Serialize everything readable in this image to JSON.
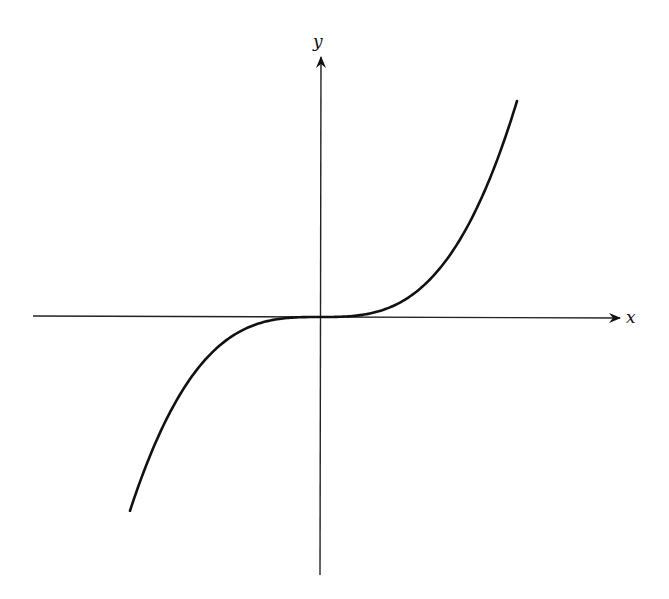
{
  "figure": {
    "function": "y = x^3",
    "x_axis_label": "x",
    "y_axis_label": "y",
    "stroke_color": "#111111",
    "background_color": "#ffffff"
  }
}
